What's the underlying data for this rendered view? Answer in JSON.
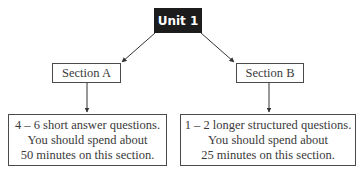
{
  "root": {
    "label": "Unit 1"
  },
  "sections": [
    {
      "label": "Section A",
      "details": [
        "4 – 6 short answer questions.",
        "You should spend about",
        "50 minutes on this section."
      ]
    },
    {
      "label": "Section B",
      "details": [
        "1 – 2 longer structured questions.",
        "You should spend about",
        "25 minutes on this section."
      ]
    }
  ],
  "colors": {
    "root_fill": "#1c1c1c",
    "root_text": "#ffffff",
    "border": "#4a4a4a",
    "text": "#3a3a3a"
  }
}
